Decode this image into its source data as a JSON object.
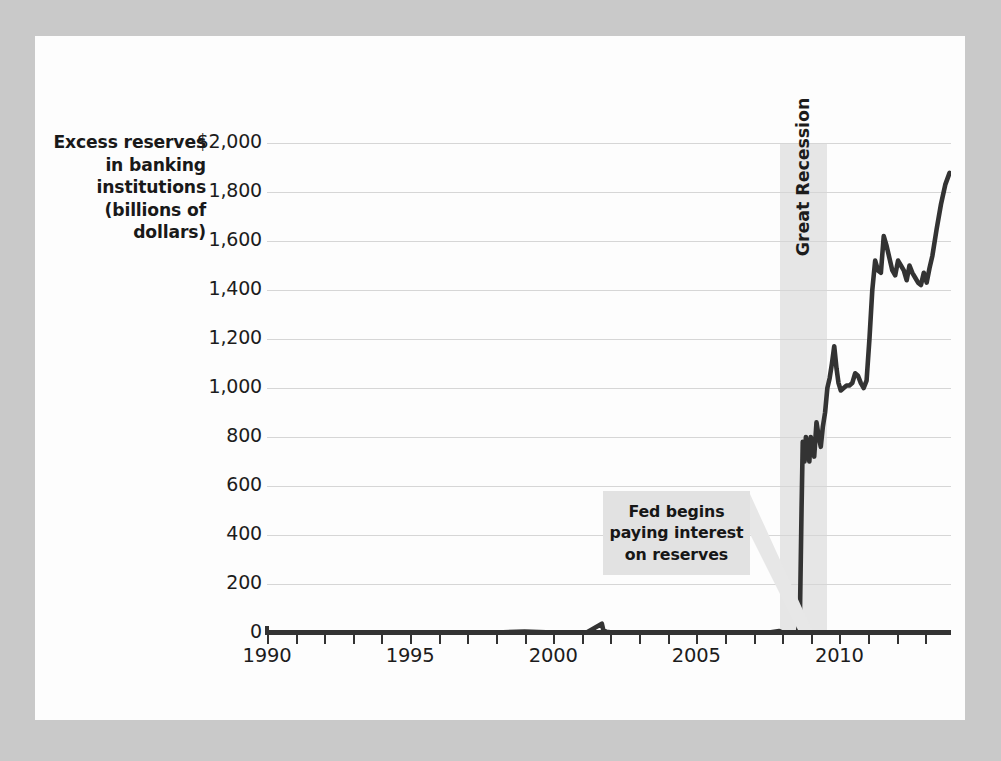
{
  "figure": {
    "background_color": "#c9c9c9",
    "page_color": "#fdfdfd",
    "line_color": "#333333",
    "gridline_color": "#d6d6d6",
    "band_color": "#e6e6e6",
    "callout_color": "#e2e2e2"
  },
  "chart_data": {
    "type": "line",
    "title": "",
    "ylabel": "Excess reserves in banking institutions (billions of dollars)",
    "xlabel": "",
    "xlim": [
      1990,
      2013.9
    ],
    "ylim": [
      0,
      2000
    ],
    "grid": true,
    "legend": "none",
    "ytick_labels": [
      "$2,000",
      "1,800",
      "1,600",
      "1,400",
      "1,200",
      "1,000",
      "800",
      "600",
      "400",
      "200",
      "0"
    ],
    "ytick_values": [
      2000,
      1800,
      1600,
      1400,
      1200,
      1000,
      800,
      600,
      400,
      200,
      0
    ],
    "xtick_labels": [
      "1990",
      "1995",
      "2000",
      "2005",
      "2010"
    ],
    "xtick_values": [
      1990,
      1995,
      2000,
      2005,
      2010
    ],
    "xtick_minor_step": 1,
    "series": [
      {
        "name": "Excess reserves",
        "x": [
          1990.0,
          1991.0,
          1992.0,
          1993.0,
          1994.0,
          1995.0,
          1996.0,
          1997.0,
          1998.0,
          1999.0,
          2000.0,
          2000.8,
          2001.2,
          2001.7,
          2001.75,
          2001.85,
          2002.0,
          2003.0,
          2004.0,
          2005.0,
          2006.0,
          2007.0,
          2007.6,
          2007.9,
          2008.0,
          2008.3,
          2008.55,
          2008.62,
          2008.68,
          2008.72,
          2008.78,
          2008.83,
          2008.88,
          2008.95,
          2009.0,
          2009.05,
          2009.12,
          2009.2,
          2009.28,
          2009.35,
          2009.42,
          2009.5,
          2009.58,
          2009.66,
          2009.74,
          2009.82,
          2009.9,
          2009.97,
          2010.05,
          2010.15,
          2010.25,
          2010.35,
          2010.45,
          2010.55,
          2010.65,
          2010.75,
          2010.85,
          2010.95,
          2011.05,
          2011.15,
          2011.25,
          2011.35,
          2011.45,
          2011.55,
          2011.65,
          2011.75,
          2011.85,
          2011.95,
          2012.05,
          2012.15,
          2012.25,
          2012.35,
          2012.45,
          2012.55,
          2012.65,
          2012.75,
          2012.85,
          2012.95,
          2013.05,
          2013.15,
          2013.25,
          2013.4,
          2013.55,
          2013.7,
          2013.85
        ],
        "y": [
          2,
          2,
          1,
          1,
          1,
          1,
          1,
          1,
          2,
          6,
          2,
          2,
          4,
          38,
          12,
          5,
          3,
          2,
          2,
          2,
          2,
          2,
          3,
          8,
          2,
          2,
          3,
          60,
          520,
          780,
          700,
          800,
          760,
          700,
          800,
          770,
          720,
          860,
          800,
          760,
          840,
          900,
          1000,
          1040,
          1100,
          1170,
          1080,
          1020,
          990,
          1000,
          1010,
          1010,
          1020,
          1060,
          1050,
          1020,
          1000,
          1030,
          1200,
          1400,
          1520,
          1480,
          1470,
          1620,
          1580,
          1530,
          1480,
          1460,
          1520,
          1500,
          1480,
          1440,
          1500,
          1470,
          1450,
          1430,
          1420,
          1470,
          1430,
          1490,
          1540,
          1650,
          1750,
          1830,
          1878
        ]
      }
    ],
    "annotations": [
      {
        "name": "fed-pays-interest-callout",
        "text": "Fed begins\npaying interest\non reserves",
        "points_to_year": 2008.6,
        "points_to_value": 20
      },
      {
        "name": "great-recession-band",
        "label": "Great Recession",
        "start_year": 2007.92,
        "end_year": 2009.58,
        "orientation": "vertical"
      }
    ]
  }
}
